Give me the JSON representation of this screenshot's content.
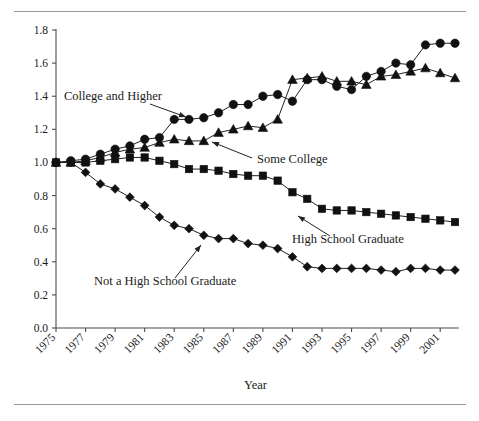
{
  "figure": {
    "rule_top": "horizontal-rule",
    "rule_bottom": "horizontal-rule"
  },
  "chart_data": {
    "type": "line",
    "title": "",
    "xlabel": "Year",
    "ylabel": "",
    "ylim": [
      0.0,
      1.8
    ],
    "xlim": [
      1975,
      2002
    ],
    "grid": false,
    "legend": "inline-annotations",
    "ytick_labels": [
      "0.0",
      "0.2",
      "0.4",
      "0.6",
      "0.8",
      "1.0",
      "1.2",
      "1.4",
      "1.6",
      "1.8"
    ],
    "ytick_values": [
      0.0,
      0.2,
      0.4,
      0.6,
      0.8,
      1.0,
      1.2,
      1.4,
      1.6,
      1.8
    ],
    "xtick_labels": [
      "1975",
      "1977",
      "1979",
      "1981",
      "1983",
      "1985",
      "1987",
      "1989",
      "1991",
      "1993",
      "1995",
      "1997",
      "1999",
      "2001"
    ],
    "xtick_values": [
      1975,
      1977,
      1979,
      1981,
      1983,
      1985,
      1987,
      1989,
      1991,
      1993,
      1995,
      1997,
      1999,
      2001
    ],
    "x": [
      1975,
      1976,
      1977,
      1978,
      1979,
      1980,
      1981,
      1982,
      1983,
      1984,
      1985,
      1986,
      1987,
      1988,
      1989,
      1990,
      1991,
      1992,
      1993,
      1994,
      1995,
      1996,
      1997,
      1998,
      1999,
      2000,
      2001,
      2002
    ],
    "series": [
      {
        "name": "College and Higher",
        "marker": "circle",
        "values": [
          1.0,
          1.01,
          1.02,
          1.05,
          1.08,
          1.1,
          1.14,
          1.15,
          1.26,
          1.26,
          1.27,
          1.3,
          1.35,
          1.35,
          1.4,
          1.41,
          1.37,
          1.5,
          1.5,
          1.46,
          1.44,
          1.52,
          1.55,
          1.6,
          1.59,
          1.71,
          1.72,
          1.72
        ]
      },
      {
        "name": "Some College",
        "marker": "triangle",
        "values": [
          1.0,
          1.0,
          1.01,
          1.03,
          1.06,
          1.08,
          1.09,
          1.12,
          1.14,
          1.13,
          1.13,
          1.18,
          1.2,
          1.22,
          1.21,
          1.26,
          1.5,
          1.51,
          1.52,
          1.49,
          1.49,
          1.47,
          1.52,
          1.53,
          1.55,
          1.57,
          1.54,
          1.51
        ]
      },
      {
        "name": "High School Graduate",
        "marker": "square",
        "values": [
          1.0,
          1.0,
          1.0,
          1.01,
          1.02,
          1.03,
          1.03,
          1.01,
          0.99,
          0.96,
          0.96,
          0.95,
          0.93,
          0.92,
          0.92,
          0.89,
          0.82,
          0.78,
          0.72,
          0.71,
          0.71,
          0.7,
          0.69,
          0.68,
          0.67,
          0.66,
          0.65,
          0.64
        ]
      },
      {
        "name": "Not a High School Graduate",
        "marker": "diamond",
        "values": [
          1.0,
          1.0,
          0.94,
          0.87,
          0.84,
          0.79,
          0.74,
          0.67,
          0.62,
          0.6,
          0.56,
          0.54,
          0.54,
          0.51,
          0.5,
          0.48,
          0.43,
          0.37,
          0.36,
          0.36,
          0.36,
          0.36,
          0.35,
          0.34,
          0.36,
          0.36,
          0.35,
          0.35
        ]
      }
    ],
    "annotations": [
      {
        "text": "College and Higher",
        "x": 1978.6,
        "y": 1.43,
        "points_to_series": "College and Higher"
      },
      {
        "text": "Some College",
        "x": 1985.0,
        "y": 1.13,
        "points_to_series": "Some College"
      },
      {
        "text": "High School Graduate",
        "x": 1991.5,
        "y": 0.72,
        "points_to_series": "High School Graduate"
      },
      {
        "text": "Not a High School Graduate",
        "x": 1978.0,
        "y": 0.42,
        "points_to_series": "Not a High School Graduate"
      }
    ]
  }
}
